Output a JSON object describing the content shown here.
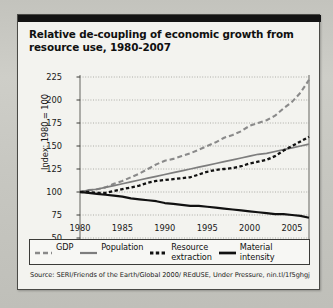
{
  "card": {
    "title": "Relative de-coupling of economic growth from resource use, 1980-2007",
    "source": "Source: SERI/Friends of the Earth/Global 2000/ REdUSE, Under Pressure, nin.tl/1f5ghgj"
  },
  "legend": [
    {
      "name": "gdp",
      "label": "GDP",
      "style": "dashed-gray"
    },
    {
      "name": "population",
      "label": "Population",
      "style": "solid-gray"
    },
    {
      "name": "resource-extraction",
      "label": "Resource\nextraction",
      "style": "dotted-black"
    },
    {
      "name": "material-intensity",
      "label": "Material\nintensity",
      "style": "solid-black"
    }
  ],
  "chart_data": {
    "type": "line",
    "title": "Relative de-coupling of economic growth from resource use, 1980-2007",
    "xlabel": "",
    "ylabel": "Index: 1980 = 100",
    "xlim": [
      1980,
      2007
    ],
    "ylim": [
      50,
      225
    ],
    "yticks": [
      225,
      200,
      175,
      150,
      125,
      100,
      75,
      50
    ],
    "xticks": [
      1980,
      1985,
      1990,
      1995,
      2000,
      2005
    ],
    "xtick_minor_step": 1,
    "grid": true,
    "grid_style": "dotted",
    "legend_position": "bottom",
    "x": [
      1980,
      1981,
      1982,
      1983,
      1984,
      1985,
      1986,
      1987,
      1988,
      1989,
      1990,
      1991,
      1992,
      1993,
      1994,
      1995,
      1996,
      1997,
      1998,
      1999,
      2000,
      2001,
      2002,
      2003,
      2004,
      2005,
      2006,
      2007
    ],
    "series": [
      {
        "name": "GDP",
        "color": "#8a8a8a",
        "dash": "5,3",
        "width": 2.1,
        "values": [
          100,
          102,
          103,
          105,
          109,
          112,
          116,
          120,
          125,
          130,
          134,
          136,
          139,
          142,
          146,
          150,
          154,
          159,
          162,
          166,
          172,
          175,
          178,
          183,
          191,
          198,
          208,
          222
        ]
      },
      {
        "name": "Population",
        "color": "#7d7d7d",
        "dash": "none",
        "width": 1.7,
        "values": [
          100,
          102,
          103,
          105,
          107,
          109,
          111,
          113,
          115,
          117,
          119,
          121,
          123,
          125,
          127,
          129,
          131,
          133,
          135,
          137,
          139,
          141,
          142,
          144,
          146,
          148,
          150,
          152
        ]
      },
      {
        "name": "Resource extraction",
        "color": "#111111",
        "dash": "3.4,2.4",
        "width": 2.3,
        "values": [
          100,
          100,
          99,
          99,
          101,
          103,
          105,
          107,
          110,
          112,
          113,
          114,
          115,
          116,
          119,
          122,
          124,
          125,
          126,
          128,
          131,
          133,
          135,
          139,
          145,
          150,
          155,
          160
        ]
      },
      {
        "name": "Material intensity",
        "color": "#111111",
        "dash": "none",
        "width": 2.2,
        "values": [
          100,
          99,
          98,
          97,
          96,
          95,
          93,
          92,
          91,
          90,
          88,
          87,
          86,
          85,
          85,
          84,
          83,
          82,
          81,
          80,
          79,
          78,
          77,
          76,
          76,
          75,
          74,
          72
        ]
      }
    ]
  }
}
